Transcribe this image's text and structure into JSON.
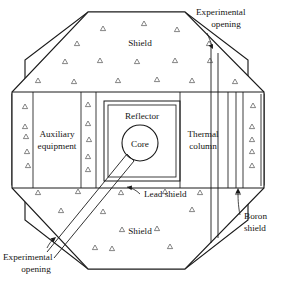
{
  "figure": {
    "type": "engineering-cross-section",
    "background_color": "#ffffff",
    "line_color": "#1a1a1a"
  },
  "labels": {
    "shield_top": "Shield",
    "shield_bottom": "Shield",
    "reflector": "Reflector",
    "core": "Core",
    "auxiliary_line1": "Auxiliary",
    "auxiliary_line2": "equipment",
    "thermal_line1": "Thermal",
    "thermal_line2": "column",
    "lead_shield": "Lead shield",
    "boron_line1": "Boron",
    "boron_line2": "shield",
    "experimental_top_line1": "Experimental",
    "experimental_top_line2": "opening",
    "experimental_bottom_line1": "Experimental",
    "experimental_bottom_line2": "opening"
  },
  "regions": [
    {
      "name": "shield",
      "description": "Octagonal concrete biological shield with triangular aggregate hatching"
    },
    {
      "name": "reflector",
      "description": "Square reflector block surrounding the core"
    },
    {
      "name": "core",
      "description": "Circular reactor core at center of reflector"
    },
    {
      "name": "auxiliary-equipment",
      "description": "Rectangular bay on the left side"
    },
    {
      "name": "thermal-column",
      "description": "Rectangular bay on the right side"
    },
    {
      "name": "lead-shield",
      "description": "Horizontal lead shield boundary below reflector"
    },
    {
      "name": "boron-shield",
      "description": "Narrow vertical strip at far right of thermal column"
    },
    {
      "name": "experimental-opening-vertical",
      "description": "Narrow vertical channel through upper right shield"
    },
    {
      "name": "experimental-opening-diagonal",
      "description": "Diagonal beam channel from core to lower left"
    }
  ],
  "hatch_marks": {
    "symbol": "triangle",
    "meaning": "concrete aggregate",
    "positions": [
      [
        103,
        29
      ],
      [
        144,
        24
      ],
      [
        177,
        30
      ],
      [
        77,
        44
      ],
      [
        209,
        44
      ],
      [
        65,
        62
      ],
      [
        100,
        61
      ],
      [
        137,
        62
      ],
      [
        175,
        61
      ],
      [
        210,
        61
      ],
      [
        38,
        81
      ],
      [
        74,
        82
      ],
      [
        118,
        81
      ],
      [
        157,
        80
      ],
      [
        192,
        81
      ],
      [
        235,
        82
      ],
      [
        26,
        107
      ],
      [
        88,
        105
      ],
      [
        26,
        127
      ],
      [
        88,
        124
      ],
      [
        253,
        106
      ],
      [
        27,
        137
      ],
      [
        89,
        140
      ],
      [
        252,
        127
      ],
      [
        252,
        140
      ],
      [
        28,
        152
      ],
      [
        88,
        157
      ],
      [
        252,
        152
      ],
      [
        29,
        166
      ],
      [
        88,
        170
      ],
      [
        252,
        166
      ],
      [
        38,
        193
      ],
      [
        78,
        192
      ],
      [
        121,
        193
      ],
      [
        165,
        192
      ],
      [
        200,
        193
      ],
      [
        238,
        193
      ],
      [
        61,
        211
      ],
      [
        103,
        212
      ],
      [
        192,
        210
      ],
      [
        122,
        230
      ],
      [
        157,
        229
      ],
      [
        95,
        248
      ],
      [
        112,
        249
      ],
      [
        170,
        247
      ]
    ]
  }
}
